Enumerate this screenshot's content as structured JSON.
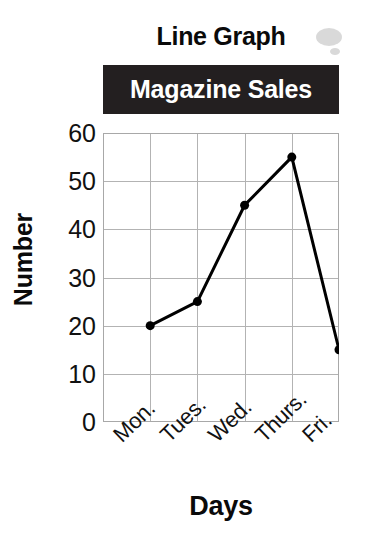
{
  "figure": {
    "title": "Line Graph",
    "banner_label": "Magazine Sales",
    "banner_bg": "#231f20",
    "banner_fg": "#ffffff",
    "background": "#ffffff"
  },
  "chart_data": {
    "type": "line",
    "title": "Line Graph",
    "subtitle": "Magazine Sales",
    "xlabel": "Days",
    "ylabel": "Number",
    "categories": [
      "Mon.",
      "Tues.",
      "Wed.",
      "Thurs.",
      "Fri."
    ],
    "values": [
      20,
      25,
      45,
      55,
      15
    ],
    "ylim": [
      0,
      60
    ],
    "ytick_values": [
      0,
      10,
      20,
      30,
      40,
      50,
      60
    ],
    "ytick_labels": [
      "0",
      "10",
      "20",
      "30",
      "40",
      "50",
      "60"
    ],
    "ystep": 10,
    "grid": true,
    "grid_color": "#b3b3b3",
    "legend": false,
    "legend_position": "none",
    "line_color": "#000000",
    "line_width": 3,
    "marker": "circle",
    "marker_color": "#000000",
    "marker_size": 9,
    "annotations": []
  }
}
